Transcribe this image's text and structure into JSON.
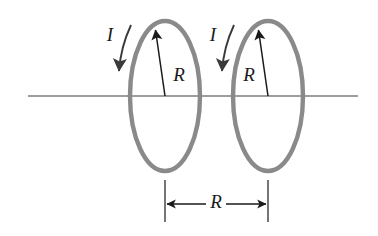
{
  "figure": {
    "canvas": {
      "width": 378,
      "height": 236,
      "background": "#ffffff"
    },
    "colors": {
      "loop_stroke": "#8a8a8a",
      "axis_stroke": "#3c3c3c",
      "annotation_stroke": "#1a1a1a",
      "label_fill": "#1a1a1a"
    },
    "axis": {
      "name": "symmetry-axis",
      "x1": 28,
      "y1": 96,
      "x2": 358,
      "y2": 96,
      "stroke_width": 1.2
    },
    "loops": [
      {
        "id": "left-loop",
        "cx": 165,
        "cy": 96,
        "rx": 35,
        "ry": 75,
        "stroke_width": 4.4,
        "current_label": "I",
        "current_label_x": 110,
        "current_label_y": 37,
        "current_arrow_path": "M 131 25 C 124 40 120 57 119 71",
        "current_arrow_tip": {
          "x": 119,
          "y": 78
        },
        "radius_label": "R",
        "radius_label_x": 179,
        "radius_label_y": 77,
        "radius_arrow": {
          "x1": 165,
          "y1": 96,
          "x2": 155.5,
          "y2": 30
        }
      },
      {
        "id": "right-loop",
        "cx": 268,
        "cy": 96,
        "rx": 35,
        "ry": 75,
        "stroke_width": 4.4,
        "current_label": "I",
        "current_label_x": 213,
        "current_label_y": 37,
        "current_arrow_path": "M 234 25 C 227 40 223 57 222 71",
        "current_arrow_tip": {
          "x": 222,
          "y": 78
        },
        "radius_label": "R",
        "radius_label_x": 249,
        "radius_label_y": 77,
        "radius_arrow": {
          "x1": 268,
          "y1": 96,
          "x2": 258.5,
          "y2": 30
        }
      }
    ],
    "dimension": {
      "name": "loop-separation-dimension",
      "label": "R",
      "label_x": 216,
      "label_y": 204,
      "line_y": 204,
      "left_x": 165,
      "right_x": 268,
      "extension_top": 180,
      "extension_bottom": 222,
      "stroke_width": 1.2
    }
  }
}
